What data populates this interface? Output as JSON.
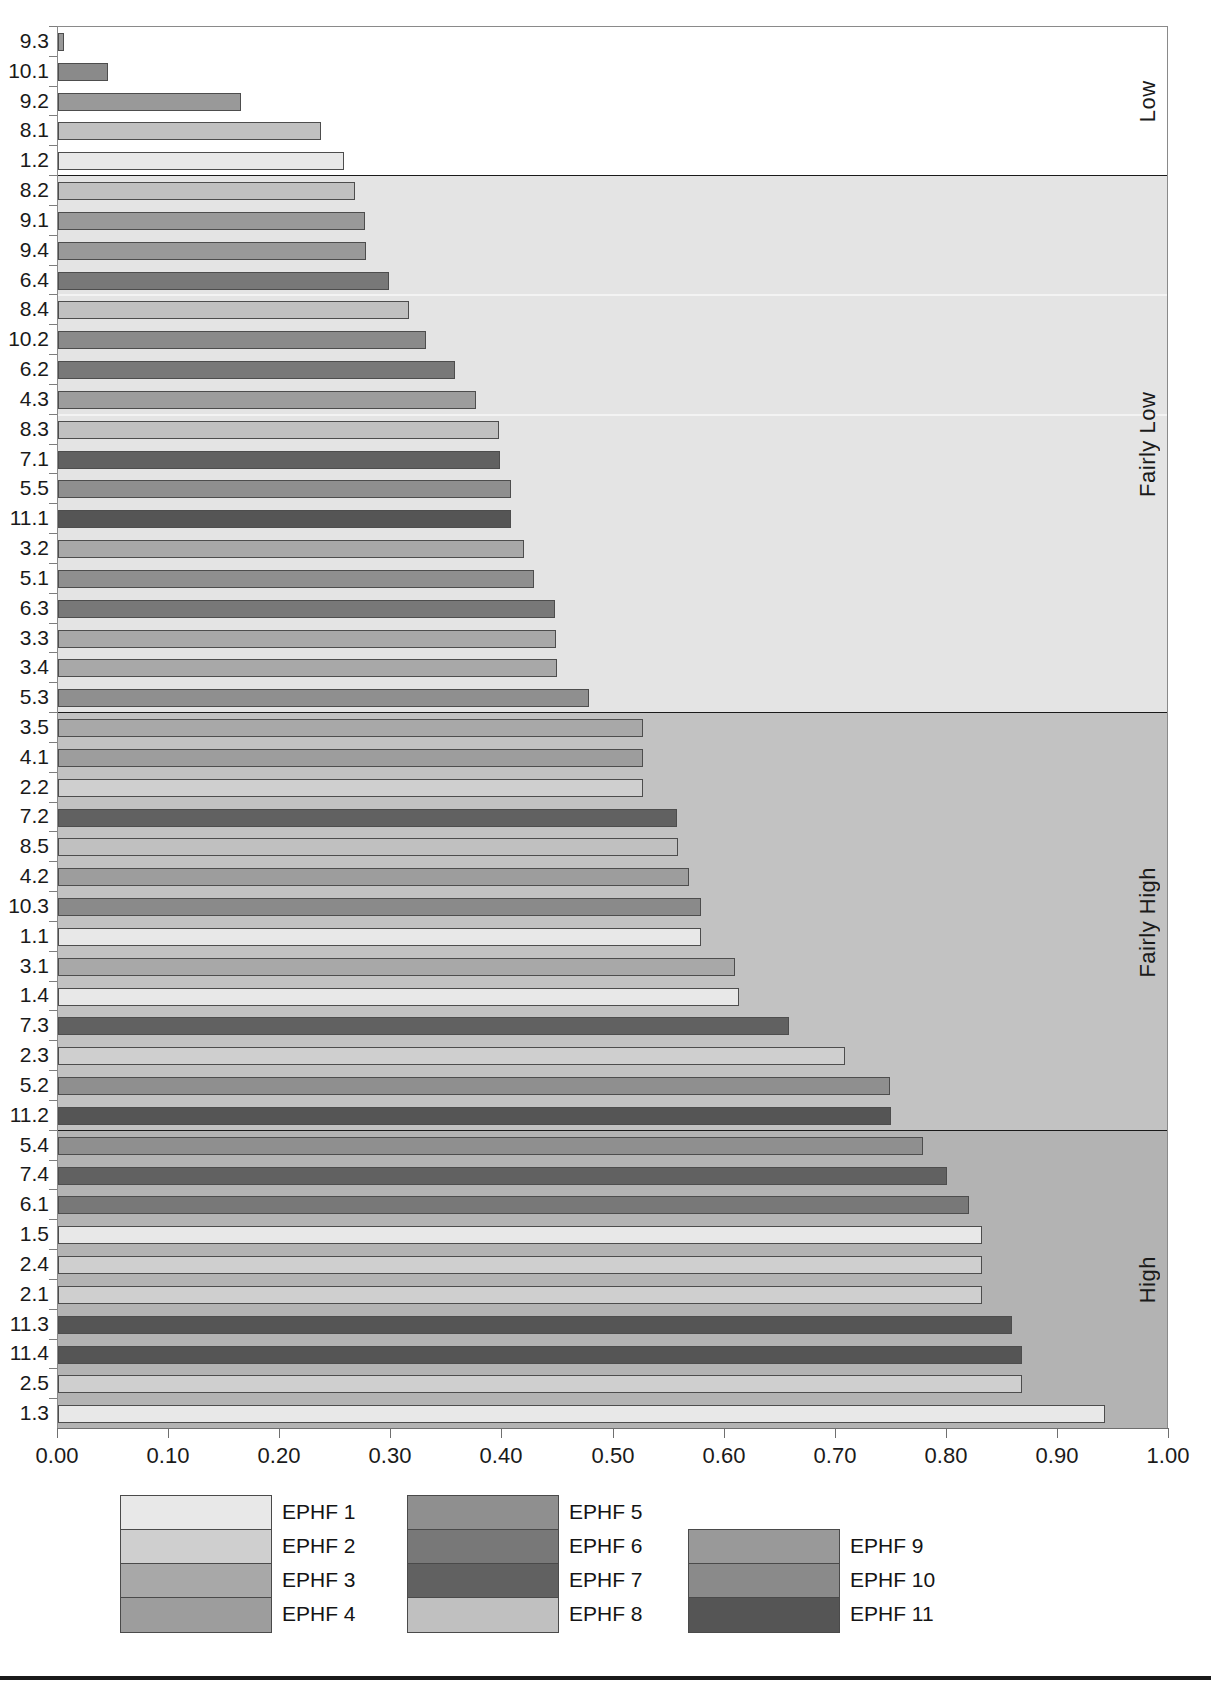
{
  "chart_data": {
    "type": "bar",
    "orientation": "horizontal",
    "title": "",
    "xlabel": "",
    "ylabel": "",
    "xlim": [
      0.0,
      1.0
    ],
    "xticks": [
      "0.00",
      "0.10",
      "0.20",
      "0.30",
      "0.40",
      "0.50",
      "0.60",
      "0.70",
      "0.80",
      "0.90",
      "1.00"
    ],
    "xtick_values": [
      0.0,
      0.1,
      0.2,
      0.3,
      0.4,
      0.5,
      0.6,
      0.7,
      0.8,
      0.9,
      1.0
    ],
    "grid": false,
    "legend_position": "bottom",
    "legend": [
      {
        "label": "EPHF 1",
        "color": "#e8e8e8"
      },
      {
        "label": "EPHF 2",
        "color": "#cfcfcf"
      },
      {
        "label": "EPHF 3",
        "color": "#a8a8a8"
      },
      {
        "label": "EPHF 4",
        "color": "#9d9d9d"
      },
      {
        "label": "EPHF 5",
        "color": "#8f8f8f"
      },
      {
        "label": "EPHF 6",
        "color": "#787878"
      },
      {
        "label": "EPHF 7",
        "color": "#616161"
      },
      {
        "label": "EPHF 8",
        "color": "#c0c0c0"
      },
      {
        "label": "EPHF 9",
        "color": "#999999"
      },
      {
        "label": "EPHF 10",
        "color": "#8a8a8a"
      },
      {
        "label": "EPHF 11",
        "color": "#555555"
      }
    ],
    "bands": [
      {
        "name": "Low",
        "background": "#ffffff",
        "count": 5
      },
      {
        "name": "Fairly Low",
        "background": "#e4e4e4",
        "count": 18
      },
      {
        "name": "Fairly High",
        "background": "#c2c2c2",
        "count": 14
      },
      {
        "name": "High",
        "background": "#b3b3b3",
        "count": 10
      }
    ],
    "categories": [
      "9.3",
      "10.1",
      "9.2",
      "8.1",
      "1.2",
      "8.2",
      "9.1",
      "9.4",
      "6.4",
      "8.4",
      "10.2",
      "6.2",
      "4.3",
      "8.3",
      "7.1",
      "5.5",
      "11.1",
      "3.2",
      "5.1",
      "6.3",
      "3.3",
      "3.4",
      "5.3",
      "3.5",
      "4.1",
      "2.2",
      "7.2",
      "8.5",
      "4.2",
      "10.3",
      "1.1",
      "3.1",
      "1.4",
      "7.3",
      "2.3",
      "5.2",
      "11.2",
      "5.4",
      "7.4",
      "6.1",
      "1.5",
      "2.4",
      "2.1",
      "11.3",
      "11.4",
      "2.5",
      "1.3"
    ],
    "values": [
      0.005,
      0.045,
      0.165,
      0.237,
      0.257,
      0.267,
      0.276,
      0.277,
      0.298,
      0.316,
      0.331,
      0.357,
      0.376,
      0.397,
      0.398,
      0.408,
      0.408,
      0.419,
      0.428,
      0.447,
      0.448,
      0.449,
      0.478,
      0.527,
      0.527,
      0.527,
      0.557,
      0.558,
      0.568,
      0.579,
      0.579,
      0.609,
      0.613,
      0.658,
      0.708,
      0.749,
      0.75,
      0.779,
      0.8,
      0.82,
      0.832,
      0.832,
      0.832,
      0.859,
      0.868,
      0.868,
      0.942
    ],
    "series_of_bar": [
      "EPHF 9",
      "EPHF 10",
      "EPHF 9",
      "EPHF 8",
      "EPHF 1",
      "EPHF 8",
      "EPHF 9",
      "EPHF 9",
      "EPHF 6",
      "EPHF 8",
      "EPHF 10",
      "EPHF 6",
      "EPHF 4",
      "EPHF 8",
      "EPHF 7",
      "EPHF 5",
      "EPHF 11",
      "EPHF 3",
      "EPHF 5",
      "EPHF 6",
      "EPHF 3",
      "EPHF 3",
      "EPHF 5",
      "EPHF 3",
      "EPHF 4",
      "EPHF 2",
      "EPHF 7",
      "EPHF 8",
      "EPHF 4",
      "EPHF 10",
      "EPHF 1",
      "EPHF 3",
      "EPHF 1",
      "EPHF 7",
      "EPHF 2",
      "EPHF 5",
      "EPHF 11",
      "EPHF 5",
      "EPHF 7",
      "EPHF 6",
      "EPHF 1",
      "EPHF 2",
      "EPHF 2",
      "EPHF 11",
      "EPHF 11",
      "EPHF 2",
      "EPHF 1"
    ]
  },
  "axis": {
    "x_tick_labels": [
      "0.00",
      "0.10",
      "0.20",
      "0.30",
      "0.40",
      "0.50",
      "0.60",
      "0.70",
      "0.80",
      "0.90",
      "1.00"
    ],
    "y_tick_labels": [
      "9.3",
      "10.1",
      "9.2",
      "8.1",
      "1.2",
      "8.2",
      "9.1",
      "9.4",
      "6.4",
      "8.4",
      "10.2",
      "6.2",
      "4.3",
      "8.3",
      "7.1",
      "5.5",
      "11.1",
      "3.2",
      "5.1",
      "6.3",
      "3.3",
      "3.4",
      "5.3",
      "3.5",
      "4.1",
      "2.2",
      "7.2",
      "8.5",
      "4.2",
      "10.3",
      "1.1",
      "3.1",
      "1.4",
      "7.3",
      "2.3",
      "5.2",
      "11.2",
      "5.4",
      "7.4",
      "6.1",
      "1.5",
      "2.4",
      "2.1",
      "11.3",
      "11.4",
      "2.5",
      "1.3"
    ]
  },
  "band_titles": [
    "Low",
    "Fairly Low",
    "Fairly High",
    "High"
  ],
  "legend_columns": [
    {
      "labels": [
        "EPHF 1",
        "EPHF 2",
        "EPHF 3",
        "EPHF 4"
      ],
      "colors": [
        "#e8e8e8",
        "#cfcfcf",
        "#a8a8a8",
        "#9d9d9d"
      ]
    },
    {
      "labels": [
        "EPHF 5",
        "EPHF 6",
        "EPHF 7",
        "EPHF 8"
      ],
      "colors": [
        "#8f8f8f",
        "#787878",
        "#616161",
        "#c0c0c0"
      ]
    },
    {
      "labels": [
        "EPHF 9",
        "EPHF 10",
        "EPHF 11"
      ],
      "colors": [
        "#999999",
        "#8a8a8a",
        "#555555"
      ]
    }
  ]
}
